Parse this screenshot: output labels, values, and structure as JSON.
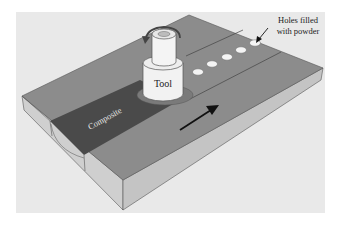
{
  "diagram": {
    "labels": {
      "tool": "Tool",
      "composite": "Composite",
      "holes_line1": "Holes filled",
      "holes_line2": "with powder"
    },
    "colors": {
      "panel_bg": "#e9e9e9",
      "plate_top": "#8a8a8a",
      "plate_side": "#c9c9c9",
      "composite_strip": "#4a4a4a",
      "tool_body": "#f2f2f2",
      "tool_outline": "#555555",
      "hole_fill": "#f4f4f4",
      "arrow": "#111111",
      "edge": "#555555"
    },
    "holes_count": 5,
    "direction_arrow": "travel-direction"
  }
}
